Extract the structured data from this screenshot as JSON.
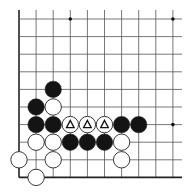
{
  "diagram": {
    "type": "go-board-fragment",
    "background": "#ffffff",
    "line_color": "#555555",
    "edge_color": "#222222",
    "grid": {
      "origin_x": 19,
      "origin_y": 19,
      "spacing_x": 17.1,
      "spacing_y": 17.6,
      "cols": 10,
      "rows": 10,
      "right_extent": 182,
      "edges": [
        "left",
        "bottom"
      ]
    },
    "star_points": [
      {
        "col": 3,
        "row": 0
      },
      {
        "col": 9,
        "row": 0
      },
      {
        "col": 9,
        "row": 6
      }
    ],
    "stones": [
      {
        "color": "black",
        "col": 2,
        "row": 4
      },
      {
        "color": "black",
        "col": 1,
        "row": 5
      },
      {
        "color": "white",
        "col": 2,
        "row": 5
      },
      {
        "color": "black",
        "col": 1,
        "row": 6
      },
      {
        "color": "black",
        "col": 2,
        "row": 6
      },
      {
        "color": "white",
        "col": 3,
        "row": 6,
        "mark": "triangle"
      },
      {
        "color": "white",
        "col": 4,
        "row": 6,
        "mark": "triangle"
      },
      {
        "color": "white",
        "col": 5,
        "row": 6,
        "mark": "triangle"
      },
      {
        "color": "black",
        "col": 6,
        "row": 6
      },
      {
        "color": "black",
        "col": 7,
        "row": 6
      },
      {
        "color": "white",
        "col": 1,
        "row": 7
      },
      {
        "color": "white",
        "col": 2,
        "row": 7
      },
      {
        "color": "black",
        "col": 3,
        "row": 7
      },
      {
        "color": "black",
        "col": 4,
        "row": 7
      },
      {
        "color": "black",
        "col": 5,
        "row": 7
      },
      {
        "color": "white",
        "col": 6,
        "row": 7
      },
      {
        "color": "white",
        "col": 0,
        "row": 8
      },
      {
        "color": "white",
        "col": 2,
        "row": 8
      },
      {
        "color": "white",
        "col": 6,
        "row": 8
      },
      {
        "color": "white",
        "col": 1,
        "row": 9
      }
    ],
    "marks": {
      "triangle": "△"
    }
  }
}
